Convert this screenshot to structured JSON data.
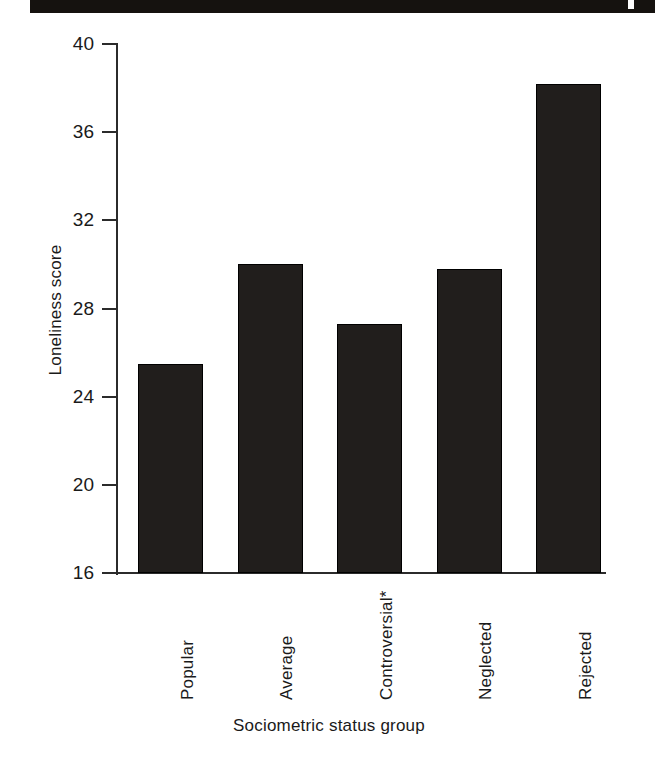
{
  "figure": {
    "scan_artifact": "page-edge-band"
  },
  "chart_data": {
    "type": "bar",
    "title": "",
    "xlabel": "Sociometric status group",
    "ylabel": "Loneliness score",
    "categories": [
      "Popular",
      "Average",
      "Controversial*",
      "Neglected",
      "Rejected"
    ],
    "values": [
      25.5,
      30.0,
      27.3,
      29.8,
      38.2
    ],
    "ylim": [
      16,
      40
    ],
    "yticks": [
      16,
      20,
      24,
      28,
      32,
      36,
      40
    ],
    "ytick_labels": [
      "16",
      "20",
      "24",
      "28",
      "32",
      "36",
      "40"
    ],
    "grid": false,
    "legend": null,
    "bar_color": "#211e1c",
    "axis_color": "#2b2b2b",
    "annotations": [
      "* asterisk on Controversial category"
    ]
  }
}
